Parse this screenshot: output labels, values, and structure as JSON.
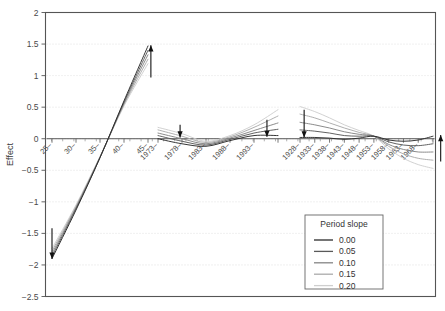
{
  "chart_data": {
    "type": "line",
    "title": "",
    "subtitle": "",
    "xlabel": "",
    "ylabel": "Effect",
    "ylim": [
      -2.5,
      2.0
    ],
    "ytick_labels": [
      "2",
      "1.5",
      "1",
      "0.5",
      "0",
      "-0.5",
      "-1",
      "-1.5",
      "-2",
      "-2.5"
    ],
    "ytick_values": [
      2,
      1.5,
      1,
      0.5,
      0,
      -0.5,
      -1,
      -1.5,
      -2,
      -2.5
    ],
    "grid": true,
    "grid_style": "dotted",
    "grid_color": "#d9d9d9",
    "frame_color": "#555555",
    "legend": {
      "position": "lower-right",
      "title": "Period slope",
      "entries": [
        {
          "label": "0.00",
          "color": "#2b2b2b"
        },
        {
          "label": "0.05",
          "color": "#5a5a5a"
        },
        {
          "label": "0.10",
          "color": "#858585"
        },
        {
          "label": "0.15",
          "color": "#ababab"
        },
        {
          "label": "0.20",
          "color": "#cfcfcf"
        }
      ]
    },
    "panels": [
      {
        "name": "age",
        "tick_labels": [
          "25",
          "30",
          "35",
          "40",
          "45"
        ],
        "tick_x": [
          25,
          30,
          35,
          40,
          45
        ],
        "series": [
          {
            "name": "0.00",
            "color": "#2b2b2b",
            "x": [
              25,
              30,
              35,
              40,
              45
            ],
            "values": [
              -1.9,
              -1.13,
              -0.3,
              0.6,
              1.47
            ]
          },
          {
            "name": "0.05",
            "color": "#5a5a5a",
            "x": [
              25,
              30,
              35,
              40,
              45
            ],
            "values": [
              -1.86,
              -1.11,
              -0.3,
              0.58,
              1.4
            ]
          },
          {
            "name": "0.10",
            "color": "#858585",
            "x": [
              25,
              30,
              35,
              40,
              45
            ],
            "values": [
              -1.82,
              -1.09,
              -0.29,
              0.56,
              1.33
            ]
          },
          {
            "name": "0.15",
            "color": "#ababab",
            "x": [
              25,
              30,
              35,
              40,
              45
            ],
            "values": [
              -1.78,
              -1.07,
              -0.29,
              0.54,
              1.26
            ]
          },
          {
            "name": "0.20",
            "color": "#cfcfcf",
            "x": [
              25,
              30,
              35,
              40,
              45
            ],
            "values": [
              -1.74,
              -1.05,
              -0.28,
              0.52,
              1.19
            ]
          }
        ],
        "annotations": [
          {
            "kind": "arrow",
            "direction": "down",
            "at_x": 25,
            "from_y": -1.42,
            "to_y": -1.9
          },
          {
            "kind": "arrow",
            "direction": "up",
            "at_x": 45.6,
            "from_y": 0.97,
            "to_y": 1.48
          }
        ]
      },
      {
        "name": "period",
        "tick_labels": [
          "1973",
          "1978",
          "1983",
          "1988",
          "1993"
        ],
        "tick_x": [
          1973,
          1978,
          1983,
          1988,
          1993
        ],
        "series": [
          {
            "name": "0.00",
            "color": "#2b2b2b",
            "x": [
              1973,
              1978,
              1983,
              1988,
              1993,
              1998
            ],
            "values": [
              0.0,
              -0.08,
              -0.12,
              -0.03,
              0.05,
              0.05
            ]
          },
          {
            "name": "0.05",
            "color": "#5a5a5a",
            "x": [
              1973,
              1978,
              1983,
              1988,
              1993,
              1998
            ],
            "values": [
              0.05,
              -0.04,
              -0.1,
              -0.01,
              0.09,
              0.15
            ]
          },
          {
            "name": "0.10",
            "color": "#858585",
            "x": [
              1973,
              1978,
              1983,
              1988,
              1993,
              1998
            ],
            "values": [
              0.09,
              0.0,
              -0.08,
              0.01,
              0.13,
              0.25
            ]
          },
          {
            "name": "0.15",
            "color": "#ababab",
            "x": [
              1973,
              1978,
              1983,
              1988,
              1993,
              1998
            ],
            "values": [
              0.14,
              0.04,
              -0.06,
              0.03,
              0.18,
              0.36
            ]
          },
          {
            "name": "0.20",
            "color": "#cfcfcf",
            "x": [
              1973,
              1978,
              1983,
              1988,
              1993,
              1998
            ],
            "values": [
              0.18,
              0.08,
              -0.04,
              0.05,
              0.22,
              0.46
            ]
          }
        ],
        "annotations": [
          {
            "kind": "arrow",
            "direction": "down",
            "at_x": 1977.6,
            "from_y": 0.22,
            "to_y": 0.02
          },
          {
            "kind": "arrow",
            "direction": "down",
            "at_x": 1995.7,
            "from_y": 0.3,
            "to_y": 0.03
          }
        ]
      },
      {
        "name": "cohort",
        "tick_labels": [
          "1928",
          "1933",
          "1938",
          "1943",
          "1948",
          "1953",
          "1958",
          "1963",
          "1968"
        ],
        "tick_x": [
          1928,
          1933,
          1938,
          1943,
          1948,
          1953,
          1958,
          1963,
          1968
        ],
        "series": [
          {
            "name": "0.00",
            "color": "#2b2b2b",
            "x": [
              1928,
              1933,
              1938,
              1943,
              1948,
              1953,
              1958,
              1963,
              1968,
              1973
            ],
            "values": [
              0.02,
              0.02,
              0.01,
              -0.01,
              0.01,
              0.04,
              -0.02,
              -0.04,
              -0.02,
              0.04
            ]
          },
          {
            "name": "0.05",
            "color": "#5a5a5a",
            "x": [
              1928,
              1933,
              1938,
              1943,
              1948,
              1953,
              1958,
              1963,
              1968,
              1973
            ],
            "values": [
              0.14,
              0.12,
              0.09,
              0.05,
              0.04,
              0.04,
              -0.05,
              -0.1,
              -0.11,
              -0.08
            ]
          },
          {
            "name": "0.10",
            "color": "#858585",
            "x": [
              1928,
              1933,
              1938,
              1943,
              1948,
              1953,
              1958,
              1963,
              1968,
              1973
            ],
            "values": [
              0.26,
              0.22,
              0.17,
              0.11,
              0.07,
              0.04,
              -0.09,
              -0.17,
              -0.21,
              -0.21
            ]
          },
          {
            "name": "0.15",
            "color": "#ababab",
            "x": [
              1928,
              1933,
              1938,
              1943,
              1948,
              1953,
              1958,
              1963,
              1968,
              1973
            ],
            "values": [
              0.39,
              0.33,
              0.25,
              0.17,
              0.1,
              0.04,
              -0.12,
              -0.24,
              -0.31,
              -0.34
            ]
          },
          {
            "name": "0.20",
            "color": "#cfcfcf",
            "x": [
              1928,
              1933,
              1938,
              1943,
              1948,
              1953,
              1958,
              1963,
              1968,
              1973
            ],
            "values": [
              0.51,
              0.43,
              0.33,
              0.22,
              0.13,
              0.04,
              -0.16,
              -0.31,
              -0.41,
              -0.47
            ]
          }
        ],
        "annotations": [
          {
            "kind": "arrow",
            "direction": "down",
            "at_x": 1929.4,
            "from_y": 0.46,
            "to_y": 0.02
          },
          {
            "kind": "arrow",
            "direction": "up",
            "at_x": 1975.6,
            "from_y": -0.36,
            "to_y": 0.06
          }
        ]
      }
    ]
  }
}
